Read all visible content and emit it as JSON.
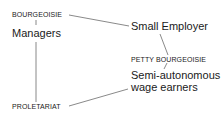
{
  "diagram": {
    "nodes": {
      "bourgeoisie": "BOURGEOISIE",
      "managers": "Managers",
      "proletariat": "PROLETARIAT",
      "small_employer": "Small Employer",
      "petty_bourgeoisie": "PETTY BOURGEOISIE",
      "semi_autonomous_line1": "Semi-autonomous",
      "semi_autonomous_line2": "wage earners"
    },
    "edges": [
      {
        "from": "BOURGEOISIE",
        "to": "Managers"
      },
      {
        "from": "Managers",
        "to": "PROLETARIAT"
      },
      {
        "from": "BOURGEOISIE",
        "to": "Small Employer"
      },
      {
        "from": "Small Employer",
        "to": "PETTY BOURGEOISIE"
      },
      {
        "from": "PETTY BOURGEOISIE",
        "to": "Semi-autonomous wage earners"
      },
      {
        "from": "Semi-autonomous wage earners",
        "to": "PROLETARIAT"
      }
    ],
    "line_color": "#6b6b6b",
    "text_color": "#1a1a1a"
  }
}
